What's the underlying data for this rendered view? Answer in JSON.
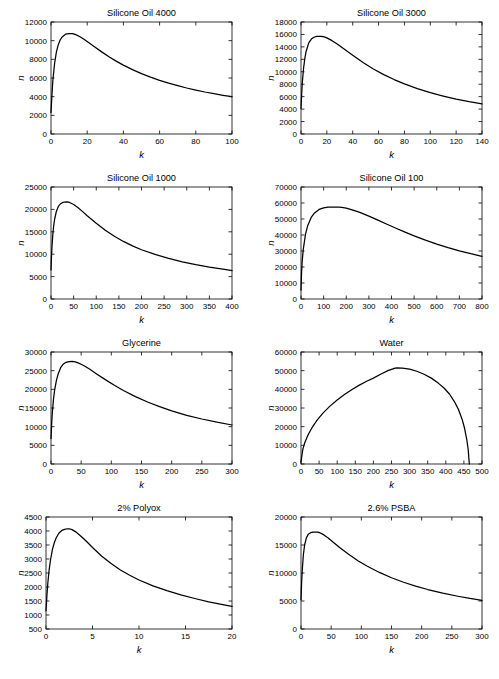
{
  "figure": {
    "panel_count": 8,
    "columns": 2,
    "rows": 4,
    "background_color": "#ffffff",
    "curve_color": "#000000"
  },
  "chart_data": [
    {
      "type": "line",
      "title": "Silicone Oil 4000",
      "xlabel": "k",
      "ylabel": "n",
      "xlim": [
        0,
        100
      ],
      "ylim": [
        0,
        12000
      ],
      "xticks": [
        0,
        20,
        40,
        60,
        80,
        100
      ],
      "yticks": [
        0,
        2000,
        4000,
        6000,
        8000,
        10000,
        12000
      ],
      "grid": false,
      "peak": {
        "x": 12,
        "y": 10750
      },
      "x": [
        0,
        0.5,
        1,
        2,
        3,
        4,
        5,
        6,
        8,
        10,
        12,
        14,
        16,
        18,
        20,
        24,
        28,
        32,
        36,
        40,
        45,
        50,
        55,
        60,
        65,
        70,
        75,
        80,
        85,
        90,
        95,
        100
      ],
      "y": [
        2300,
        4100,
        5700,
        7600,
        8800,
        9550,
        10050,
        10370,
        10690,
        10750,
        10750,
        10620,
        10420,
        10180,
        9920,
        9360,
        8800,
        8280,
        7810,
        7380,
        6900,
        6470,
        6090,
        5750,
        5450,
        5180,
        4930,
        4710,
        4500,
        4320,
        4150,
        4000
      ]
    },
    {
      "type": "line",
      "title": "Silicone Oil 3000",
      "xlabel": "k",
      "ylabel": "n",
      "xlim": [
        0,
        140
      ],
      "ylim": [
        0,
        18000
      ],
      "xticks": [
        0,
        20,
        40,
        60,
        80,
        100,
        120,
        140
      ],
      "yticks": [
        0,
        2000,
        4000,
        6000,
        8000,
        10000,
        12000,
        14000,
        16000,
        18000
      ],
      "grid": false,
      "peak": {
        "x": 16,
        "y": 15700
      },
      "x": [
        0,
        0.5,
        1,
        2,
        3,
        4,
        6,
        8,
        10,
        12,
        14,
        16,
        18,
        20,
        24,
        28,
        32,
        36,
        40,
        48,
        56,
        64,
        72,
        80,
        90,
        100,
        110,
        120,
        130,
        140
      ],
      "y": [
        4100,
        6400,
        8200,
        10600,
        12200,
        13300,
        14650,
        15250,
        15550,
        15680,
        15710,
        15700,
        15600,
        15450,
        15000,
        14450,
        13850,
        13250,
        12650,
        11500,
        10450,
        9550,
        8750,
        8050,
        7300,
        6650,
        6100,
        5600,
        5200,
        4850
      ]
    },
    {
      "type": "line",
      "title": "Silicone Oil 1000",
      "xlabel": "k",
      "ylabel": "n",
      "xlim": [
        0,
        400
      ],
      "ylim": [
        0,
        25000
      ],
      "xticks": [
        0,
        50,
        100,
        150,
        200,
        250,
        300,
        350,
        400
      ],
      "yticks": [
        0,
        5000,
        10000,
        15000,
        20000,
        25000
      ],
      "grid": false,
      "peak": {
        "x": 35,
        "y": 21700
      },
      "x": [
        0,
        1,
        2,
        4,
        6,
        8,
        12,
        16,
        20,
        25,
        30,
        35,
        40,
        50,
        60,
        70,
        80,
        100,
        120,
        140,
        160,
        180,
        200,
        230,
        260,
        290,
        320,
        350,
        380,
        400
      ],
      "y": [
        6500,
        9200,
        11400,
        14400,
        16400,
        17800,
        19600,
        20600,
        21150,
        21500,
        21650,
        21700,
        21600,
        21100,
        20350,
        19500,
        18600,
        16900,
        15350,
        14000,
        12850,
        11850,
        11000,
        9950,
        9050,
        8300,
        7650,
        7100,
        6650,
        6350
      ]
    },
    {
      "type": "line",
      "title": "Silicone Oil 100",
      "xlabel": "k",
      "ylabel": "n",
      "xlim": [
        0,
        800
      ],
      "ylim": [
        0,
        70000
      ],
      "xticks": [
        0,
        100,
        200,
        300,
        400,
        500,
        600,
        700,
        800
      ],
      "yticks": [
        0,
        10000,
        20000,
        30000,
        40000,
        50000,
        60000,
        70000
      ],
      "grid": false,
      "peak": {
        "x": 170,
        "y": 57500
      },
      "x": [
        0,
        2,
        5,
        10,
        20,
        30,
        45,
        60,
        80,
        100,
        120,
        140,
        160,
        170,
        180,
        200,
        230,
        260,
        300,
        340,
        380,
        420,
        460,
        500,
        550,
        600,
        650,
        700,
        750,
        800
      ],
      "y": [
        5500,
        15000,
        23000,
        31000,
        40500,
        46000,
        51000,
        53800,
        56000,
        57000,
        57400,
        57500,
        57500,
        57450,
        57300,
        56800,
        55600,
        54100,
        51800,
        49300,
        46700,
        44200,
        41800,
        39500,
        36800,
        34300,
        32100,
        30100,
        28300,
        26700
      ]
    },
    {
      "type": "line",
      "title": "Glycerine",
      "xlabel": "k",
      "ylabel": "n",
      "xlim": [
        0,
        300
      ],
      "ylim": [
        0,
        30000
      ],
      "xticks": [
        0,
        50,
        100,
        150,
        200,
        250,
        300
      ],
      "yticks": [
        0,
        5000,
        10000,
        15000,
        20000,
        25000,
        30000
      ],
      "grid": false,
      "peak": {
        "x": 35,
        "y": 27500
      },
      "x": [
        0,
        1,
        2,
        4,
        6,
        9,
        12,
        16,
        20,
        25,
        30,
        35,
        40,
        45,
        55,
        65,
        75,
        90,
        105,
        120,
        140,
        160,
        180,
        200,
        225,
        250,
        275,
        300
      ],
      "y": [
        6800,
        10500,
        13300,
        17200,
        19800,
        22400,
        24200,
        25800,
        26700,
        27250,
        27450,
        27500,
        27350,
        27100,
        26300,
        25300,
        24200,
        22600,
        21100,
        19700,
        18050,
        16600,
        15350,
        14250,
        13050,
        12050,
        11200,
        10450
      ]
    },
    {
      "type": "line",
      "title": "Water",
      "xlabel": "k",
      "ylabel": "n",
      "xlim": [
        0,
        500
      ],
      "ylim": [
        0,
        60000
      ],
      "xticks": [
        0,
        50,
        100,
        150,
        200,
        250,
        300,
        350,
        400,
        450,
        500
      ],
      "yticks": [
        0,
        10000,
        20000,
        30000,
        40000,
        50000,
        60000
      ],
      "grid": false,
      "peak": {
        "x": 265,
        "y": 51500
      },
      "cutoff": 465,
      "x": [
        0,
        5,
        10,
        20,
        30,
        45,
        60,
        80,
        100,
        120,
        140,
        160,
        180,
        200,
        220,
        240,
        260,
        265,
        280,
        300,
        320,
        340,
        360,
        380,
        395,
        410,
        425,
        435,
        445,
        452,
        458,
        462,
        465
      ],
      "y": [
        1200,
        7800,
        11200,
        15800,
        19300,
        23600,
        27100,
        31000,
        34300,
        37200,
        39800,
        42100,
        44200,
        46000,
        48100,
        50000,
        51400,
        51500,
        51400,
        50800,
        49700,
        48100,
        46000,
        43200,
        40700,
        37500,
        33000,
        29200,
        24000,
        19000,
        13000,
        7500,
        0
      ]
    },
    {
      "type": "line",
      "title": "2% Polyox",
      "xlabel": "k",
      "ylabel": "n",
      "xlim": [
        0,
        20
      ],
      "ylim": [
        500,
        4500
      ],
      "xticks": [
        0,
        5,
        10,
        15,
        20
      ],
      "yticks": [
        500,
        1000,
        1500,
        2000,
        2500,
        3000,
        3500,
        4000,
        4500
      ],
      "grid": false,
      "peak": {
        "x": 2.5,
        "y": 4080
      },
      "x": [
        0,
        0.1,
        0.2,
        0.35,
        0.5,
        0.7,
        0.9,
        1.1,
        1.4,
        1.7,
        2,
        2.3,
        2.5,
        2.8,
        3.2,
        3.6,
        4,
        4.5,
        5,
        6,
        7,
        8,
        9,
        10,
        11.5,
        13,
        14.5,
        16,
        17.5,
        19,
        20
      ],
      "y": [
        1150,
        1700,
        2150,
        2650,
        3000,
        3350,
        3590,
        3760,
        3930,
        4020,
        4060,
        4080,
        4080,
        4050,
        3970,
        3860,
        3740,
        3580,
        3410,
        3100,
        2840,
        2610,
        2420,
        2250,
        2040,
        1870,
        1720,
        1590,
        1470,
        1370,
        1310
      ]
    },
    {
      "type": "line",
      "title": "2.6% PSBA",
      "xlabel": "k",
      "ylabel": "n",
      "xlim": [
        0,
        300
      ],
      "ylim": [
        0,
        20000
      ],
      "xticks": [
        0,
        50,
        100,
        150,
        200,
        250,
        300
      ],
      "yticks": [
        0,
        5000,
        10000,
        15000,
        20000
      ],
      "grid": false,
      "peak": {
        "x": 28,
        "y": 17300
      },
      "x": [
        0,
        1,
        2,
        4,
        6,
        9,
        12,
        16,
        20,
        24,
        28,
        32,
        38,
        45,
        55,
        65,
        80,
        95,
        110,
        130,
        150,
        170,
        190,
        210,
        235,
        260,
        280,
        300
      ],
      "y": [
        5200,
        8200,
        10400,
        13300,
        15000,
        16300,
        16900,
        17200,
        17300,
        17300,
        17300,
        17150,
        16800,
        16250,
        15350,
        14450,
        13250,
        12150,
        11200,
        10100,
        9150,
        8350,
        7650,
        7050,
        6400,
        5850,
        5450,
        5100
      ]
    }
  ]
}
